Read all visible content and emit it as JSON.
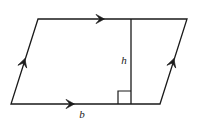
{
  "figure": {
    "name": "parallelogram-with-height",
    "background_color": "#ffffff",
    "stroke_color": "#1a1a1a",
    "stroke_width": 1.3,
    "canvas": {
      "width": 197,
      "height": 123
    },
    "vertices": {
      "top_left": {
        "x": 38,
        "y": 19
      },
      "top_right": {
        "x": 187,
        "y": 19
      },
      "bottom_right": {
        "x": 160,
        "y": 104
      },
      "bottom_left": {
        "x": 11,
        "y": 104
      }
    },
    "outline_points": "38,19 187,19 160,104 11,104",
    "height_segment": {
      "name": "height-line",
      "x1": 131,
      "y1": 19,
      "x2": 131,
      "y2": 104
    },
    "right_angle_marker": {
      "name": "right-angle-square",
      "x": 118,
      "y": 91,
      "size": 13,
      "path": "M 118 104 L 118 91 L 131 91"
    },
    "labels": {
      "height": {
        "text": "h",
        "x": 124,
        "y": 64,
        "anchor": "middle",
        "style": "italic"
      },
      "base": {
        "text": "b",
        "x": 82,
        "y": 118,
        "anchor": "middle",
        "style": "italic"
      }
    },
    "tick_arrows": [
      {
        "name": "arrow-top-edge",
        "edge": "top",
        "direction": "right",
        "position": {
          "x": 103,
          "y": 19
        },
        "angle_deg": 0,
        "count": 1
      },
      {
        "name": "arrow-bottom-edge",
        "edge": "bottom",
        "direction": "right",
        "position": {
          "x": 73,
          "y": 104
        },
        "angle_deg": 0,
        "count": 1
      },
      {
        "name": "arrow-left-edge",
        "edge": "left",
        "direction": "up-right",
        "position": {
          "x": 24.4,
          "y": 60
        },
        "angle_deg": -72.4,
        "count": 1
      },
      {
        "name": "arrow-right-edge",
        "edge": "right",
        "direction": "up-right",
        "position": {
          "x": 173.4,
          "y": 60
        },
        "angle_deg": -72.4,
        "count": 1
      }
    ]
  }
}
